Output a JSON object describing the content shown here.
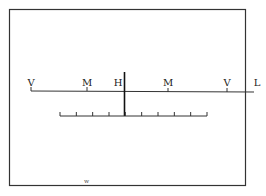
{
  "diagram": {
    "top_labels": [
      {
        "text": "V",
        "x": 31
      },
      {
        "text": "M",
        "x": 87
      },
      {
        "text": "H",
        "x": 118
      },
      {
        "text": "M",
        "x": 168
      },
      {
        "text": "V",
        "x": 227
      },
      {
        "text": "L",
        "x": 257
      }
    ],
    "footer_mark": "w",
    "scale_ticks": 10,
    "colors": {
      "line": "#222222",
      "frame": "#333333"
    }
  }
}
